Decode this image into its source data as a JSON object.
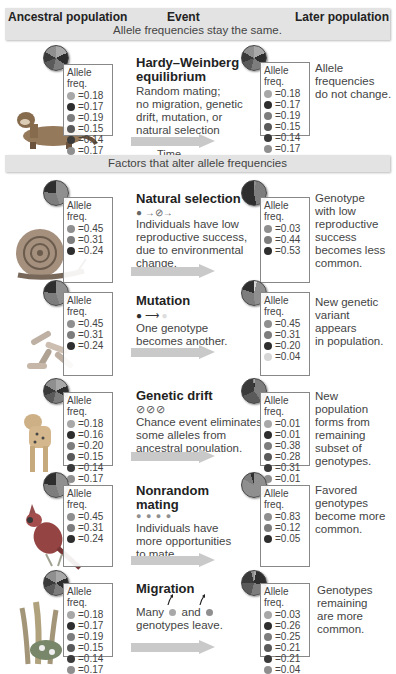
{
  "header": {
    "col_ancestral": "Ancestral population",
    "col_event": "Event",
    "col_later": "Later population",
    "band_same": "Allele frequencies stay the same.",
    "band_alter": "Factors that alter allele frequencies"
  },
  "colors": {
    "light": "#a8a8a8",
    "dark": "#2e2e2e",
    "mid": "#7d7d7d",
    "midDark": "#5a5a5a",
    "darker": "#3a3a3a",
    "midLight": "#8f8f8f",
    "pale": "#d6d6d6",
    "band": "#e3e3e3",
    "arrow": "#c9c9c9"
  },
  "box_header": "Allele freq.",
  "time_label": "Time",
  "rows": [
    {
      "id": "hardy",
      "title": "Hardy–Weinberg equilibrium",
      "title_lines": [
        "Hardy–Weinberg",
        "equilibrium"
      ],
      "description": "Random mating; no migration, genetic drift, mutation, or natural selection",
      "desc_lines": [
        "Random mating;",
        "no migration, genetic",
        "drift, mutation, or",
        "natural selection"
      ],
      "animal": "ferret",
      "ancestral": [
        "0.18",
        "0.17",
        "0.19",
        "0.15",
        "0.14",
        "0.17"
      ],
      "later": [
        "0.18",
        "0.17",
        "0.19",
        "0.15",
        "0.14",
        "0.17"
      ],
      "note_lines": [
        "Allele",
        "frequencies",
        "do not change."
      ]
    },
    {
      "id": "natural-selection",
      "title": "Natural selection",
      "title_lines": [
        "Natural selection"
      ],
      "symbol": "● →⊘→",
      "description": "Individuals have low reproductive success, due to environmental change.",
      "desc_lines": [
        "Individuals have low",
        "reproductive success,",
        "due to environmental",
        "change."
      ],
      "animal": "snail",
      "ancestral": [
        "0.45",
        "0.31",
        "0.24"
      ],
      "later": [
        "0.03",
        "0.44",
        "0.53"
      ],
      "note_lines": [
        "Genotype",
        "with low",
        "reproductive",
        "success",
        "becomes less",
        "common."
      ]
    },
    {
      "id": "mutation",
      "title": "Mutation",
      "title_lines": [
        "Mutation"
      ],
      "symbol": "● → ●",
      "description": "One genotype becomes another.",
      "desc_lines": [
        "One genotype",
        "becomes another."
      ],
      "animal": "bacteria",
      "ancestral": [
        "0.45",
        "0.31",
        "0.24"
      ],
      "later": [
        "0.45",
        "0.31",
        "0.20",
        "0.04"
      ],
      "note_lines": [
        "New genetic",
        "variant",
        "appears",
        "in population."
      ]
    },
    {
      "id": "genetic-drift",
      "title": "Genetic drift",
      "title_lines": [
        "Genetic drift"
      ],
      "symbol": "⊘⊘⊘",
      "description": "Chance event eliminates some alleles from ancestral population.",
      "desc_lines": [
        "Chance event eliminates",
        "some alleles from",
        "ancestral population."
      ],
      "animal": "cheetah",
      "ancestral": [
        "0.18",
        "0.16",
        "0.20",
        "0.15",
        "0.14",
        "0.17"
      ],
      "later": [
        "0.01",
        "0.01",
        "0.38",
        "0.28",
        "0.31",
        "0.01"
      ],
      "note_lines": [
        "New",
        "population",
        "forms from",
        "remaining",
        "subset of",
        "genotypes."
      ]
    },
    {
      "id": "nonrandom-mating",
      "title": "Nonrandom mating",
      "title_lines": [
        "Nonrandom",
        "mating"
      ],
      "symbol": "● ● ● ●",
      "description": "Individuals have more opportunities to mate.",
      "desc_lines": [
        "Individuals have",
        "more opportunities",
        "to mate."
      ],
      "animal": "cardinal",
      "ancestral": [
        "0.45",
        "0.31",
        "0.24"
      ],
      "later": [
        "0.83",
        "0.12",
        "0.05"
      ],
      "note_lines": [
        "Favored",
        "genotypes",
        "become more",
        "common."
      ]
    },
    {
      "id": "migration",
      "title": "Migration",
      "title_lines": [
        "Migration"
      ],
      "description": "Many ● and ● genotypes leave.",
      "desc_lines": [
        "Many",
        "and",
        "genotypes leave."
      ],
      "animal": "plant",
      "ancestral": [
        "0.18",
        "0.17",
        "0.19",
        "0.15",
        "0.14",
        "0.17"
      ],
      "later": [
        "0.03",
        "0.26",
        "0.25",
        "0.21",
        "0.21",
        "0.04"
      ],
      "note_lines": [
        "Genotypes",
        "remaining",
        "are more",
        "common."
      ]
    }
  ]
}
